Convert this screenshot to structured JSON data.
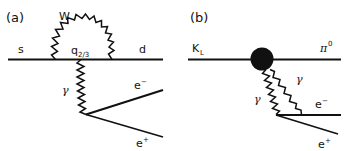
{
  "figure": {
    "width": 344,
    "height": 151,
    "background": "#ffffff",
    "ink_color": "#111111"
  },
  "panels": [
    {
      "id": "a",
      "label": "(a)",
      "description": "Short-distance electroweak penguin diagram for s to d transition with W loop and virtual photon converting to an electron-positron pair",
      "particles": {
        "incoming_quark": "s",
        "outgoing_quark": "d",
        "loop_boson": "W",
        "loop_quark_base": "q",
        "loop_quark_subscript": "2/3",
        "photon": "γ",
        "lepton_minus_base": "e",
        "lepton_minus_sup": "−",
        "lepton_plus_base": "e",
        "lepton_plus_sup": "+"
      }
    },
    {
      "id": "b",
      "label": "(b)",
      "description": "Long-distance diagram: K-long decays through a hadronic blob to a neutral pion plus two photons that convert to an electron-positron pair",
      "particles": {
        "incoming_meson_base": "K",
        "incoming_meson_subscript": "L",
        "outgoing_meson_base": "π",
        "outgoing_meson_sup": "0",
        "photon_left": "γ",
        "photon_right": "γ",
        "lepton_minus_base": "e",
        "lepton_minus_sup": "−",
        "lepton_plus_base": "e",
        "lepton_plus_sup": "+"
      }
    }
  ]
}
